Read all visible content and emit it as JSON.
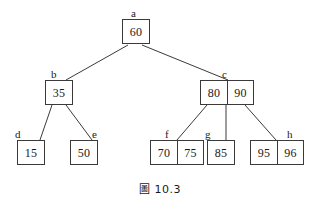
{
  "figure": {
    "caption_symbol": "圖",
    "caption_number": "10.3",
    "caption_full": "圖 10.3",
    "line_color": "#3a3a3a",
    "box_border_color": "#3a3a3a",
    "text_color": "#1a1a1a",
    "background_color": "#ffffff"
  },
  "tree": {
    "type": "b-tree",
    "nodes": [
      {
        "id": "a",
        "label": "a",
        "keys": [
          "60"
        ],
        "level": 0,
        "x": 122,
        "y": 19,
        "label_x": 131,
        "label_y": 8
      },
      {
        "id": "b",
        "label": "b",
        "keys": [
          "35"
        ],
        "level": 1,
        "x": 45,
        "y": 80,
        "label_x": 51,
        "label_y": 69
      },
      {
        "id": "c",
        "label": "c",
        "keys": [
          "80",
          "90"
        ],
        "level": 1,
        "x": 200,
        "y": 80,
        "label_x": 222,
        "label_y": 69
      },
      {
        "id": "d",
        "label": "d",
        "keys": [
          "15"
        ],
        "level": 2,
        "x": 17,
        "y": 140,
        "label_x": 15,
        "label_y": 129
      },
      {
        "id": "e",
        "label": "e",
        "keys": [
          "50"
        ],
        "level": 2,
        "x": 70,
        "y": 140,
        "label_x": 92,
        "label_y": 129
      },
      {
        "id": "f",
        "label": "f",
        "keys": [
          "70",
          "75"
        ],
        "level": 2,
        "x": 150,
        "y": 140,
        "label_x": 165,
        "label_y": 129
      },
      {
        "id": "g",
        "label": "g",
        "keys": [
          "85"
        ],
        "level": 2,
        "x": 207,
        "y": 140,
        "label_x": 205,
        "label_y": 129
      },
      {
        "id": "h",
        "label": "h",
        "keys": [
          "95",
          "96"
        ],
        "level": 2,
        "x": 250,
        "y": 140,
        "label_x": 287,
        "label_y": 129
      }
    ],
    "edges": [
      {
        "from": "a",
        "to": "b",
        "x1": 128,
        "y1": 45,
        "x2": 66,
        "y2": 80
      },
      {
        "from": "a",
        "to": "c",
        "x1": 142,
        "y1": 45,
        "x2": 228,
        "y2": 80
      },
      {
        "from": "b",
        "to": "d",
        "x1": 52,
        "y1": 105,
        "x2": 40,
        "y2": 140
      },
      {
        "from": "b",
        "to": "e",
        "x1": 66,
        "y1": 105,
        "x2": 92,
        "y2": 140
      },
      {
        "from": "c",
        "to": "f",
        "x1": 207,
        "y1": 105,
        "x2": 177,
        "y2": 140
      },
      {
        "from": "c",
        "to": "g",
        "x1": 226,
        "y1": 105,
        "x2": 226,
        "y2": 140
      },
      {
        "from": "c",
        "to": "h",
        "x1": 245,
        "y1": 105,
        "x2": 276,
        "y2": 140
      }
    ]
  }
}
